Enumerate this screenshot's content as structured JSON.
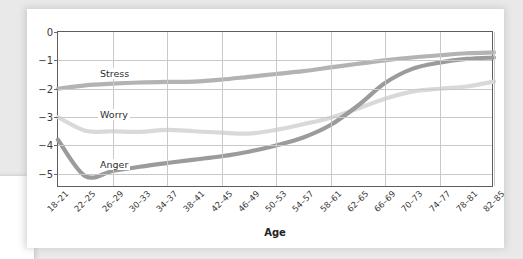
{
  "chart_data": {
    "type": "line",
    "title": "",
    "xlabel": "Age",
    "ylabel": "",
    "grid": true,
    "legend_position": "inline-labels",
    "yaxis_inverted": true,
    "ylim": [
      -5.5,
      0
    ],
    "ytick_labels": [
      "−5",
      "−4",
      "−3",
      "−2",
      "−1",
      "0"
    ],
    "ytick_values": [
      -5,
      -4,
      -3,
      -2,
      -1,
      0
    ],
    "categories": [
      "18–21",
      "22–25",
      "26–29",
      "30–33",
      "34–37",
      "38–41",
      "42–45",
      "46–49",
      "50–53",
      "54–57",
      "58–61",
      "62–65",
      "66–69",
      "70–73",
      "74–77",
      "78–81",
      "82–85"
    ],
    "series": [
      {
        "name": "Stress",
        "color": "#9b9b9b",
        "label_x": 40,
        "label_y": 36,
        "values": [
          -3.8,
          -5.08,
          -4.9,
          -4.75,
          -4.62,
          -4.5,
          -4.38,
          -4.22,
          -4.0,
          -3.72,
          -3.28,
          -2.6,
          -1.8,
          -1.3,
          -1.08,
          -0.95,
          -0.9
        ]
      },
      {
        "name": "Worry",
        "color": "#d9d9d9",
        "label_x": 40,
        "label_y": 77,
        "values": [
          -3.0,
          -3.48,
          -3.5,
          -3.52,
          -3.45,
          -3.5,
          -3.55,
          -3.58,
          -3.45,
          -3.25,
          -3.02,
          -2.7,
          -2.35,
          -2.1,
          -2.0,
          -1.92,
          -1.75
        ]
      },
      {
        "name": "Anger",
        "color": "#b3b3b3",
        "label_x": 40,
        "label_y": 127,
        "values": [
          -2.0,
          -1.88,
          -1.82,
          -1.78,
          -1.76,
          -1.75,
          -1.68,
          -1.58,
          -1.48,
          -1.38,
          -1.25,
          -1.12,
          -1.0,
          -0.9,
          -0.82,
          -0.75,
          -0.72
        ]
      }
    ]
  }
}
